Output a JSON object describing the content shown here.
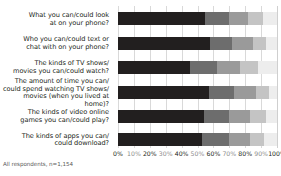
{
  "footnote": "All respondents, n=1,154",
  "chart_data": {
    "type": "bar",
    "subtype": "stacked-horizontal-100pct",
    "title": "",
    "xlabel": "",
    "ylabel": "",
    "xlim": [
      0,
      100
    ],
    "grid": true,
    "grid_axis": "x",
    "legend": "none",
    "xticks": [
      0,
      10,
      20,
      30,
      40,
      50,
      60,
      70,
      80,
      90,
      100
    ],
    "xtick_labels": [
      "0%",
      "10%",
      "20%",
      "30%",
      "40%",
      "50%",
      "60%",
      "70%",
      "80%",
      "90%",
      "100%"
    ],
    "categories": [
      "What you can/could look\nat on your phone?",
      "Who you can/could text or\nchat with on your phone?",
      "The kinds of TV shows/\nmovies you can/could watch?",
      "The amount of time you can/\ncould spend watching TV shows/\nmovies (when you lived at home)?",
      "The kinds of video online\ngames you can/could play?",
      "The kinds of apps you can/\ncould download?"
    ],
    "series": [
      {
        "name": "Segment 1",
        "color": "#221f1f",
        "values": [
          55,
          58,
          45,
          57,
          54,
          53
        ]
      },
      {
        "name": "Segment 2",
        "color": "#6d6d6d",
        "values": [
          15,
          14,
          17,
          16,
          16,
          17
        ]
      },
      {
        "name": "Segment 3",
        "color": "#9a9a9a",
        "values": [
          12,
          13,
          15,
          14,
          13,
          13
        ]
      },
      {
        "name": "Segment 4",
        "color": "#c4c4c4",
        "values": [
          9,
          8,
          11,
          8,
          10,
          9
        ]
      },
      {
        "name": "Segment 5",
        "color": "#ededed",
        "values": [
          9,
          7,
          12,
          5,
          7,
          8
        ]
      }
    ]
  }
}
